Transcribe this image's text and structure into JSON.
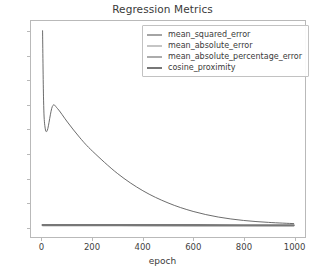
{
  "chart_data": {
    "type": "line",
    "title": "Regression Metrics",
    "xlabel": "epoch",
    "ylabel": "",
    "xlim": [
      -45,
      1045
    ],
    "ylim": [
      -4.2,
      84.5
    ],
    "xticks": [
      0,
      200,
      400,
      600,
      800,
      1000
    ],
    "yticks": [
      0,
      10,
      20,
      30,
      40,
      50,
      60,
      70,
      80
    ],
    "xtick_labels": [
      "0",
      "200",
      "400",
      "600",
      "800",
      "1000"
    ],
    "ytick_labels": [
      "0",
      "10",
      "20",
      "30",
      "40",
      "50",
      "60",
      "70",
      "80"
    ],
    "grid": false,
    "legend_position": "upper right",
    "series": [
      {
        "name": "mean_squared_error",
        "color": "#4a4a4a",
        "linewidth": 0.9,
        "x": [
          1,
          200,
          400,
          600,
          800,
          1000
        ],
        "values": [
          0.92,
          0.58,
          0.46,
          0.42,
          0.41,
          0.4
        ]
      },
      {
        "name": "mean_absolute_error",
        "color": "#8c8c8c",
        "linewidth": 0.9,
        "x": [
          1,
          200,
          400,
          600,
          800,
          1000
        ],
        "values": [
          0.78,
          0.62,
          0.56,
          0.53,
          0.52,
          0.52
        ]
      },
      {
        "name": "mean_absolute_percentage_error",
        "color": "#5a5a5a",
        "linewidth": 0.9,
        "x": [
          1,
          5,
          10,
          20,
          40,
          60,
          100,
          150,
          200,
          300,
          400,
          500,
          600,
          700,
          800,
          900,
          1000
        ],
        "values": [
          80.5,
          52.0,
          41.5,
          39.6,
          49.4,
          48.6,
          43.0,
          36.5,
          31.0,
          21.8,
          14.8,
          9.8,
          6.3,
          4.0,
          2.6,
          1.8,
          1.3
        ]
      },
      {
        "name": "cosine_proximity",
        "color": "#777777",
        "linewidth": 2.2,
        "x": [
          1,
          200,
          400,
          600,
          800,
          1000
        ],
        "values": [
          0.7,
          0.68,
          0.66,
          0.64,
          0.63,
          0.62
        ]
      }
    ]
  }
}
